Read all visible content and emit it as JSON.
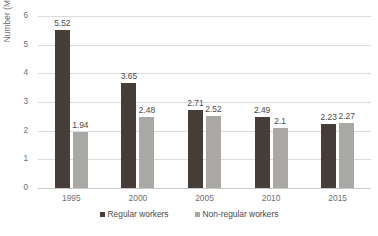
{
  "chart_data": {
    "type": "bar",
    "title": "",
    "subtitle": "",
    "xlabel": "",
    "ylabel": "Number (Million)",
    "categories": [
      "1995",
      "2000",
      "2005",
      "2010",
      "2015"
    ],
    "series": [
      {
        "name": "Regular workers",
        "color": "#463c38",
        "values": [
          5.52,
          3.65,
          2.71,
          2.49,
          2.23
        ]
      },
      {
        "name": "Non-regular workers",
        "color": "#a9a8a4",
        "values": [
          1.94,
          2.48,
          2.52,
          2.1,
          2.27
        ]
      }
    ],
    "ylim": [
      0,
      6
    ],
    "y_ticks": [
      "0",
      "1",
      "2",
      "3",
      "4",
      "5",
      "6"
    ],
    "grid": true,
    "legend_position": "bottom",
    "data_labels": true,
    "background_color": "#ffffff",
    "gridline_color": "#dcdcdc",
    "axis_text_color": "#6f6f6f"
  }
}
